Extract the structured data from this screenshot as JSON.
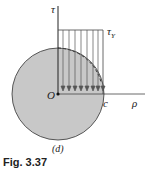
{
  "figure": {
    "caption": "Fig. 3.37",
    "sublabel": "(d)",
    "axes": {
      "vertical": "τ",
      "horizontal": "ρ",
      "origin": "O"
    },
    "labels": {
      "stress": "τ",
      "stress_sub": "Y",
      "radius_point": "c"
    },
    "colors": {
      "fill": "#c8c8c8",
      "line": "#222222"
    },
    "arrow_count": 8
  }
}
